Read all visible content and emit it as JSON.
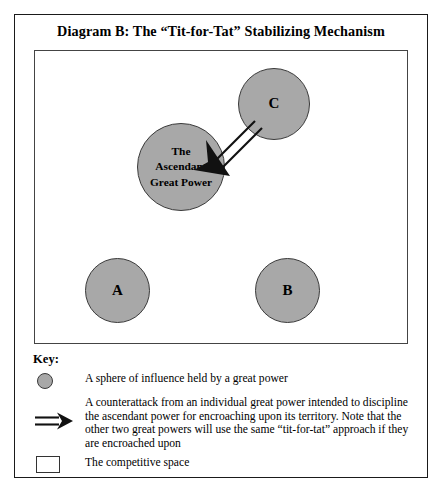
{
  "figure": {
    "title": "Diagram B: The “Tit-for-Tat” Stabilizing Mechanism"
  },
  "diagram": {
    "spheres": [
      {
        "id": "c",
        "label": "C"
      },
      {
        "id": "ascendant",
        "label": "The\nAscendant\nGreat Power"
      },
      {
        "id": "a",
        "label": "A"
      },
      {
        "id": "b",
        "label": "B"
      }
    ],
    "arrow": {
      "from": "C",
      "to": "The Ascendant Great Power",
      "style": "double-line-open-shaft-solid-head"
    }
  },
  "key": {
    "heading": "Key:",
    "items": [
      {
        "icon": "grey-circle",
        "text": "A sphere of influence held by a great power"
      },
      {
        "icon": "double-line-arrow",
        "text": "A counterattack from an individual great power intended to discipline the ascendant power for encroaching upon its territory. Note that the other two great powers will use the same “tit-for-tat” approach if they are encroached upon"
      },
      {
        "icon": "white-square",
        "text": "The competitive space"
      }
    ]
  },
  "colors": {
    "sphere_fill": "#a8a8a8",
    "sphere_stroke": "#3a3a3a",
    "frame_stroke": "#1a1a1a",
    "inner_frame_stroke": "#444444",
    "arrow_stroke": "#111111",
    "page_background": "#ffffff"
  }
}
